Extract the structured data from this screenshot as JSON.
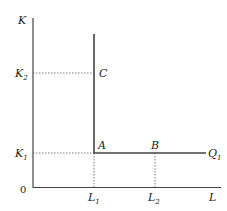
{
  "diagram": {
    "type": "fixed-proportions isoquant (Leontief)",
    "axes": {
      "y_label": "K",
      "x_label": "L",
      "origin_label": "0"
    },
    "ticks": {
      "y": [
        {
          "base": "K",
          "sub": "2"
        },
        {
          "base": "K",
          "sub": "1"
        }
      ],
      "x": [
        {
          "base": "L",
          "sub": "1"
        },
        {
          "base": "L",
          "sub": "2"
        }
      ]
    },
    "points": {
      "A": "A",
      "B": "B",
      "C": "C"
    },
    "curve": {
      "base": "Q",
      "sub": "1"
    },
    "colors": {
      "line": "#444444",
      "dotted": "#555555",
      "text": "#222222"
    }
  }
}
